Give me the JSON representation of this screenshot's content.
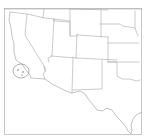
{
  "map": {
    "type": "state-boundary-map",
    "region": "Southwestern United States",
    "background_color": "#ffffff",
    "line_color": "#a8a8a8",
    "frame_color": "#c8c8c8",
    "highlight": {
      "shape": "circle",
      "location": "Southern California coast / Channel Islands",
      "color": "#7a7a7a"
    },
    "states_visible": [
      "California",
      "Nevada",
      "Oregon",
      "Idaho",
      "Utah",
      "Arizona",
      "Wyoming",
      "Colorado",
      "New Mexico",
      "Nebraska",
      "Kansas",
      "Oklahoma",
      "Texas"
    ]
  }
}
